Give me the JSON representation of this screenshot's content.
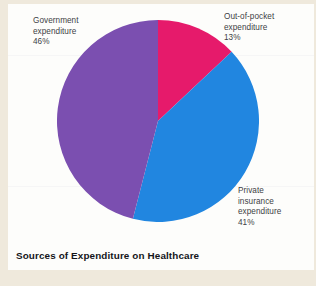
{
  "chart_data": {
    "type": "pie",
    "title": "Sources of Expenditure on Healthcare",
    "xlabel": "",
    "ylabel": "",
    "legend_position": "none",
    "grid": false,
    "units": "percent",
    "total": 100,
    "start_angle_deg": 0,
    "direction": "clockwise",
    "categories": [
      "Out-of-pocket expenditure",
      "Private insurance expenditure",
      "Government expenditure"
    ],
    "values": [
      13,
      41,
      46
    ],
    "slices": [
      {
        "name": "Out-of-pocket expenditure",
        "value": 13,
        "value_label": "13%",
        "color": "#e61a6b",
        "label_lines": "Out-of-pocket\nexpenditure\n13%"
      },
      {
        "name": "Private insurance expenditure",
        "value": 41,
        "value_label": "41%",
        "color": "#2186e0",
        "label_lines": "Private\ninsurance\nexpenditure\n41%"
      },
      {
        "name": "Government expenditure",
        "value": 46,
        "value_label": "46%",
        "color": "#7b4fb0",
        "label_lines": "Government\nexpenditure\n46%"
      }
    ]
  },
  "page": {
    "background_color": "#efe9dc",
    "card_color": "#fdfdfb",
    "text_color": "#3d3f45",
    "title_color": "#141519"
  }
}
